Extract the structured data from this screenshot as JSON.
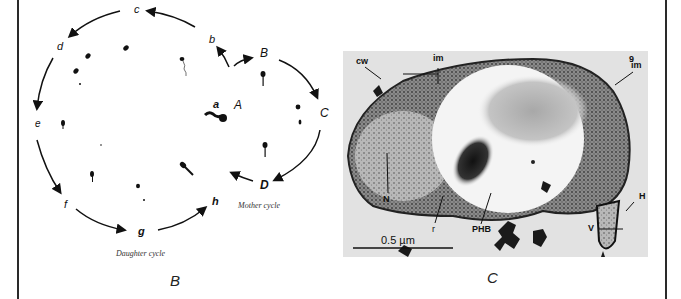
{
  "figure": {
    "panels": [
      {
        "id": "B",
        "panel_label": "B",
        "type": "life-cycle-diagram",
        "cycle_captions": {
          "mother": "Mother cycle",
          "daughter": "Daughter cycle"
        },
        "stage_labels": {
          "a": "a",
          "b": "b",
          "c": "c",
          "d": "d",
          "e": "e",
          "f": "f",
          "g": "g",
          "h": "h",
          "A": "A",
          "B": "B",
          "C": "C",
          "D": "D"
        }
      },
      {
        "id": "C",
        "panel_label": "C",
        "type": "electron-micrograph",
        "figure_number": "9",
        "annotations": {
          "cw": "cw",
          "im_top": "im",
          "im_right": "im",
          "N": "N",
          "r": "r",
          "PHB": "PHB",
          "H": "H",
          "V": "V"
        },
        "scale_bar": "0.5 µm"
      }
    ]
  }
}
